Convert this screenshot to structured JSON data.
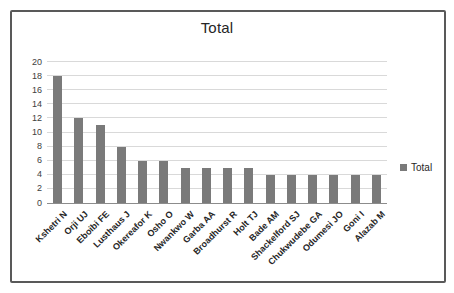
{
  "chart_data": {
    "type": "bar",
    "title": "Total",
    "categories": [
      "Kshetri N",
      "Orji UJ",
      "Eboibi FE",
      "Lusthaus J",
      "Okereafor K",
      "Osho O",
      "Nwankwo W",
      "Garba AA",
      "Broadhurst R",
      "Holt TJ",
      "Bade AM",
      "Shackelford SJ",
      "Chukwudebe GA",
      "Odumesi JO",
      "Goni I",
      "Alazab M"
    ],
    "series": [
      {
        "name": "Total",
        "values": [
          18,
          12,
          11,
          8,
          6,
          6,
          5,
          5,
          5,
          5,
          4,
          4,
          4,
          4,
          4,
          4
        ]
      }
    ],
    "ylim": [
      0,
      20
    ],
    "yticks": [
      0,
      2,
      4,
      6,
      8,
      10,
      12,
      14,
      16,
      18,
      20
    ],
    "grid": true,
    "xlabel": "",
    "ylabel": "",
    "legend": {
      "label": "Total",
      "position": "right"
    },
    "colors": {
      "bar": "#7a7a7a",
      "gridline": "#d9d9d9",
      "axis_line": "#8c8c8c",
      "frame_border": "#595959",
      "text": "#262626"
    }
  }
}
